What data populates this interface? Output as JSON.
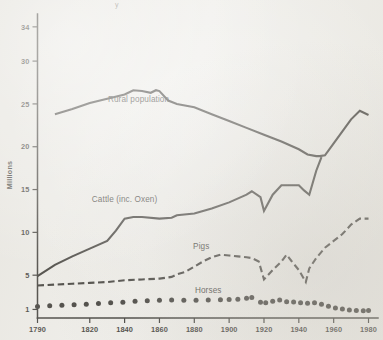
{
  "figure": {
    "background_color": "#efeeea",
    "ink_color": "#15130f",
    "corner_mark": "y"
  },
  "chart_data": {
    "type": "line",
    "title": "",
    "subtitle": "",
    "xlabel": "",
    "ylabel": "Millions",
    "grid": false,
    "legend_position": "inline-annotations",
    "xlim": [
      1790,
      1982
    ],
    "ylim": [
      0,
      35.5
    ],
    "x_ticks": [
      1790,
      1820,
      1840,
      1860,
      1880,
      1900,
      1920,
      1940,
      1960,
      1980
    ],
    "x_tick_labels": [
      "1790",
      "1820",
      "1840",
      "1860",
      "1880",
      "1900",
      "1920",
      "1940",
      "1960",
      "1980"
    ],
    "y_ticks": [
      1,
      5,
      10,
      15,
      20,
      25,
      30,
      34
    ],
    "y_tick_labels": [
      "1",
      "5",
      "10",
      "15",
      "20",
      "25",
      "30",
      "34"
    ],
    "series": [
      {
        "name": "Rural population",
        "style": "solid",
        "label": "Rural population",
        "label_x": 1848,
        "label_y": 25.2,
        "x": [
          1800,
          1810,
          1820,
          1830,
          1840,
          1845,
          1850,
          1855,
          1858,
          1860,
          1865,
          1870,
          1880,
          1890,
          1900,
          1910,
          1920,
          1930,
          1940,
          1945,
          1950,
          1952,
          1955,
          1960,
          1965,
          1970,
          1975,
          1980
        ],
        "values": [
          23.8,
          24.4,
          25.1,
          25.6,
          26.1,
          26.6,
          26.5,
          26.3,
          26.6,
          26.5,
          25.4,
          25.0,
          24.6,
          23.8,
          23.0,
          22.2,
          21.4,
          20.6,
          19.7,
          19.1,
          18.9,
          18.9,
          19.0,
          20.4,
          21.8,
          23.2,
          24.2,
          23.7
        ]
      },
      {
        "name": "Cattle (inc. Oxen)",
        "style": "solid",
        "label": "Cattle (inc. Oxen)",
        "label_x": 1840,
        "label_y": 13.6,
        "x": [
          1790,
          1800,
          1810,
          1820,
          1830,
          1835,
          1840,
          1845,
          1850,
          1860,
          1867,
          1870,
          1880,
          1890,
          1900,
          1910,
          1913,
          1918,
          1920,
          1925,
          1930,
          1935,
          1940,
          1943,
          1946,
          1950,
          1953
        ],
        "values": [
          4.9,
          6.2,
          7.2,
          8.1,
          9.0,
          10.2,
          11.6,
          11.8,
          11.8,
          11.6,
          11.7,
          12.0,
          12.2,
          12.8,
          13.5,
          14.4,
          14.8,
          14.1,
          12.5,
          14.4,
          15.5,
          15.5,
          15.5,
          14.9,
          14.4,
          17.2,
          18.8
        ]
      },
      {
        "name": "Pigs",
        "style": "dashed",
        "label": "Pigs",
        "label_x": 1884,
        "label_y": 8.1,
        "x": [
          1790,
          1800,
          1810,
          1820,
          1830,
          1840,
          1850,
          1860,
          1867,
          1870,
          1875,
          1880,
          1885,
          1890,
          1895,
          1900,
          1905,
          1910,
          1913,
          1917,
          1920,
          1925,
          1930,
          1933,
          1936,
          1940,
          1944,
          1946,
          1950,
          1955,
          1960,
          1965,
          1970,
          1975,
          1980
        ],
        "values": [
          3.8,
          3.9,
          4.0,
          4.1,
          4.2,
          4.4,
          4.5,
          4.6,
          4.8,
          5.1,
          5.4,
          6.0,
          6.6,
          7.1,
          7.4,
          7.3,
          7.2,
          7.1,
          7.0,
          6.6,
          4.5,
          5.6,
          6.6,
          7.4,
          6.6,
          5.6,
          4.2,
          5.8,
          7.0,
          8.2,
          9.0,
          9.8,
          10.9,
          11.6,
          11.6
        ]
      },
      {
        "name": "Horses",
        "style": "dotted",
        "label": "Horses",
        "label_x": 1888,
        "label_y": 2.9,
        "x": [
          1790,
          1797,
          1804,
          1811,
          1818,
          1825,
          1832,
          1839,
          1846,
          1853,
          1860,
          1867,
          1874,
          1881,
          1888,
          1895,
          1900,
          1905,
          1910,
          1913,
          1918,
          1921,
          1925,
          1929,
          1933,
          1937,
          1941,
          1945,
          1949,
          1953,
          1957,
          1961,
          1965,
          1969,
          1973,
          1977,
          1980
        ],
        "values": [
          1.35,
          1.42,
          1.5,
          1.55,
          1.62,
          1.7,
          1.78,
          1.85,
          1.95,
          2.0,
          2.08,
          2.1,
          2.08,
          2.08,
          2.1,
          2.12,
          2.15,
          2.2,
          2.3,
          2.4,
          1.85,
          1.78,
          1.95,
          2.1,
          1.9,
          1.88,
          1.78,
          1.72,
          1.78,
          1.6,
          1.38,
          1.18,
          1.05,
          0.92,
          0.88,
          0.86,
          0.88
        ]
      }
    ]
  }
}
